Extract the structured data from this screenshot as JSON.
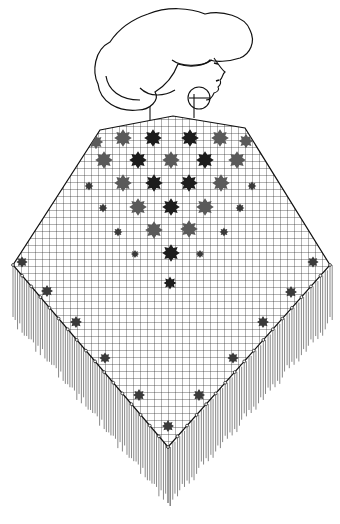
{
  "illustration": {
    "subject": "woman-in-fringed-shawl",
    "colors": {
      "background": "#ffffff",
      "line": "#1a1a1a",
      "flower_dark": "#1c1c1c",
      "flower_mid": "#555555",
      "fringe": "#666666"
    },
    "elements": [
      "hair",
      "face-profile",
      "hoop-earring",
      "neck",
      "grid-shawl",
      "flower-motifs",
      "fringe"
    ]
  }
}
